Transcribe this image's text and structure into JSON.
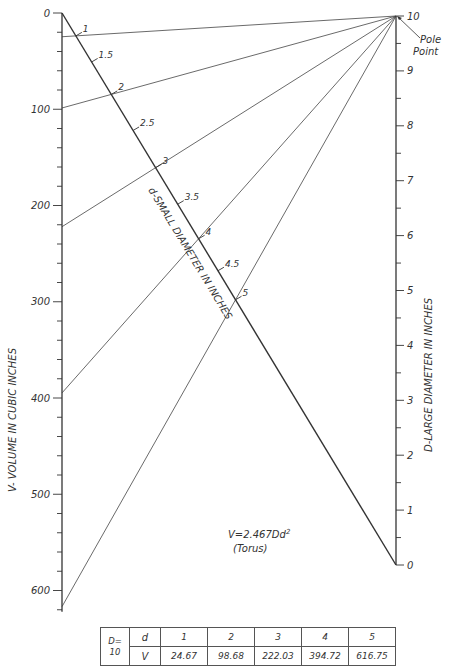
{
  "chart_data": {
    "type": "nomogram",
    "subtitle": "(Torus)",
    "formula": "V=2.467Dd²",
    "axes": {
      "v_scale": {
        "label": "V- VOLUME IN CUBIC INCHES",
        "range": [
          0,
          620
        ],
        "major_ticks": [
          0,
          100,
          200,
          300,
          400,
          500,
          600
        ],
        "minor_tick_step": 20
      },
      "d_small_scale": {
        "label": "d-SMALL DIAMETER IN INCHES",
        "tick_labels": [
          "1",
          "1.5",
          "2",
          "2.5",
          "3",
          "3.5",
          "4",
          "4.5",
          "5"
        ]
      },
      "d_large_scale": {
        "label": "D-LARGE DIAMETER IN INCHES",
        "range": [
          0,
          10
        ],
        "major_ticks": [
          0,
          1,
          2,
          3,
          4,
          5,
          6,
          7,
          8,
          9,
          10
        ],
        "minor_tick_step": 0.5
      }
    },
    "annotations": [
      "Pole Point"
    ],
    "pole_point": {
      "D": 10
    },
    "example_lines": [
      {
        "D": 10,
        "d": 1,
        "V": 24.67
      },
      {
        "D": 10,
        "d": 2,
        "V": 98.68
      },
      {
        "D": 10,
        "d": 3,
        "V": 222.03
      },
      {
        "D": 10,
        "d": 4,
        "V": 394.72
      },
      {
        "D": 10,
        "d": 5,
        "V": 616.75
      }
    ]
  },
  "labels": {
    "v_axis_title": "V- VOLUME IN CUBIC INCHES",
    "d_small_title": "d-SMALL DIAMETER IN INCHES",
    "d_large_title": "D-LARGE DIAMETER IN INCHES",
    "pole_line1": "Pole",
    "pole_line2": "Point",
    "formula": "V=2.467Dd",
    "formula_exp": "2",
    "formula_sub": "(Torus)"
  },
  "table": {
    "d_header_label": "D=",
    "d_header_value": "10",
    "row1_label": "d",
    "row2_label": "V",
    "d_values": [
      "1",
      "2",
      "3",
      "4",
      "5"
    ],
    "v_values": [
      "24.67",
      "98.68",
      "222.03",
      "394.72",
      "616.75"
    ]
  }
}
